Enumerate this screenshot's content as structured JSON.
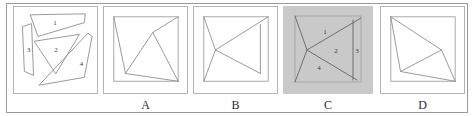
{
  "figure": {
    "kind": "geometric-dissection-multiple-choice",
    "background_color": "#ffffff",
    "frame_color": "#9a9a9a",
    "line_color": "#8c8c8c",
    "shaded_panel_color": "#c9c9c9"
  },
  "panels": [
    {
      "id": "pieces",
      "label": "",
      "shaded": false,
      "piece_numbers": [
        "1",
        "2",
        "3",
        "4"
      ],
      "description": "four scattered dissection pieces"
    },
    {
      "id": "option-a",
      "label": "A",
      "shaded": false,
      "piece_numbers": [],
      "description": "square with assembled cut lines"
    },
    {
      "id": "option-b",
      "label": "B",
      "shaded": false,
      "piece_numbers": [],
      "description": "square with assembled cut lines"
    },
    {
      "id": "option-c",
      "label": "C",
      "shaded": true,
      "piece_numbers": [
        "1",
        "2",
        "3",
        "4"
      ],
      "description": "gray shaded square with the four pieces numbered"
    },
    {
      "id": "option-d",
      "label": "D",
      "shaded": false,
      "piece_numbers": [],
      "description": "square with assembled cut lines"
    }
  ],
  "labels": {
    "a": "A",
    "b": "B",
    "c": "C",
    "d": "D"
  },
  "piece_labels": {
    "one": "1",
    "two": "2",
    "three": "3",
    "four": "4"
  }
}
